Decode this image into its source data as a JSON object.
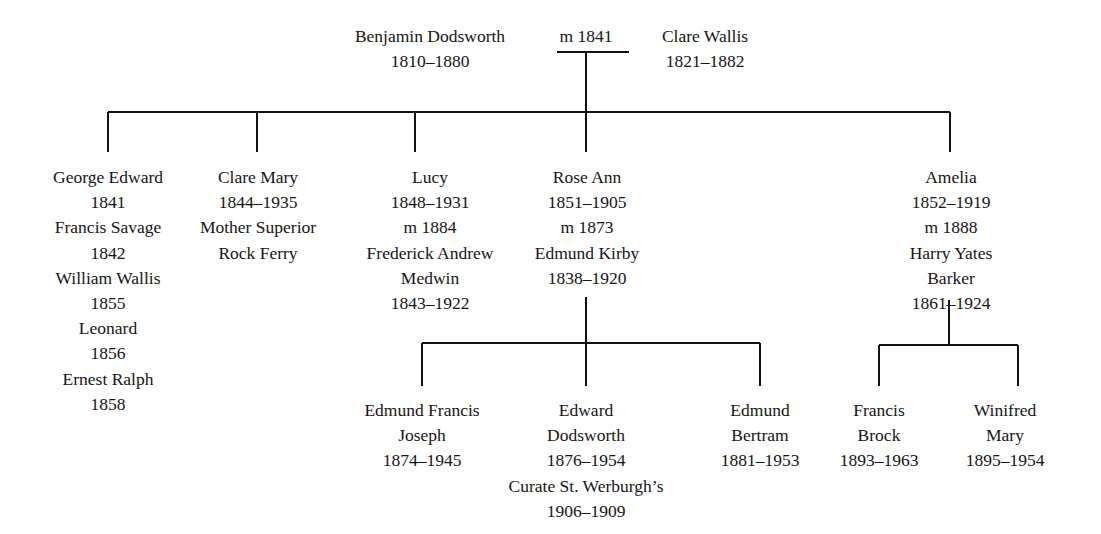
{
  "diagram": {
    "type": "family-tree",
    "line_color": "#111111"
  },
  "generation1": {
    "father": {
      "name": "Benjamin Dodsworth",
      "dates": "1810–1880"
    },
    "marriage": {
      "label": "m 1841"
    },
    "mother": {
      "name": "Clare Wallis",
      "dates": "1821–1882"
    }
  },
  "generation2": [
    {
      "id": "george",
      "lines": [
        "George Edward",
        "1841",
        "Francis Savage",
        "1842",
        "William Wallis",
        "1855",
        "Leonard",
        "1856",
        "Ernest Ralph",
        "1858"
      ]
    },
    {
      "id": "clare-mary",
      "lines": [
        "Clare Mary",
        "1844–1935",
        "Mother Superior",
        "Rock Ferry"
      ]
    },
    {
      "id": "lucy",
      "lines": [
        "Lucy",
        "1848–1931",
        "m 1884",
        "Frederick Andrew",
        "Medwin",
        "1843–1922"
      ]
    },
    {
      "id": "rose-ann",
      "lines": [
        "Rose Ann",
        "1851–1905",
        "m 1873",
        "Edmund Kirby",
        "1838–1920"
      ]
    },
    {
      "id": "amelia",
      "lines": [
        "Amelia",
        "1852–1919",
        "m 1888",
        "Harry Yates",
        "Barker",
        "1861–1924"
      ]
    }
  ],
  "generation3": [
    {
      "id": "edmund-francis-joseph",
      "lines": [
        "Edmund Francis",
        "Joseph",
        "1874–1945"
      ]
    },
    {
      "id": "edward-dodsworth",
      "lines": [
        "Edward",
        "Dodsworth",
        "1876–1954",
        "Curate St. Werburgh’s",
        "1906–1909"
      ]
    },
    {
      "id": "edmund-bertram",
      "lines": [
        "Edmund",
        "Bertram",
        "1881–1953"
      ]
    },
    {
      "id": "francis-brock",
      "lines": [
        "Francis",
        "Brock",
        "1893–1963"
      ]
    },
    {
      "id": "winifred-mary",
      "lines": [
        "Winifred",
        "Mary",
        "1895–1954"
      ]
    }
  ]
}
